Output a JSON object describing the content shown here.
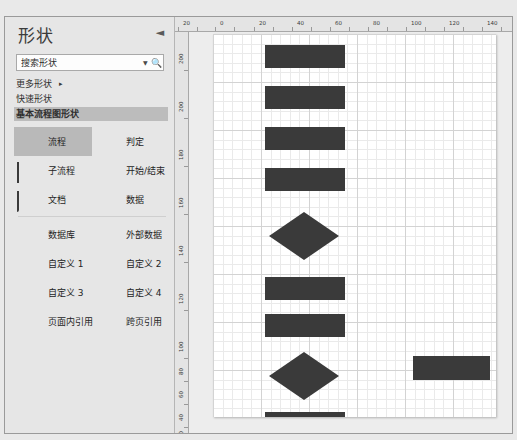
{
  "panel": {
    "title": "形状",
    "collapse_icon": "chevron-left-icon",
    "search": {
      "value": "搜索形状",
      "placeholder": "搜索形状",
      "dropdown_icon": "chevron-down-icon",
      "search_icon": "magnifier-icon"
    },
    "menu": [
      {
        "label": "更多形状",
        "arrow": "▸",
        "selected": false
      },
      {
        "label": "快速形状",
        "arrow": "",
        "selected": false
      },
      {
        "label": "基本流程图形状",
        "arrow": "",
        "selected": true
      }
    ],
    "shape_groups": [
      {
        "rows": [
          [
            {
              "label": "流程",
              "glyph": "rect-filled-icon",
              "selected": true
            },
            {
              "label": "判定",
              "glyph": "diamond-icon",
              "selected": false
            }
          ],
          [
            {
              "label": "子流程",
              "glyph": "subprocess-icon",
              "selected": false
            },
            {
              "label": "开始/结束",
              "glyph": "rounded-terminator-icon",
              "selected": false
            }
          ],
          [
            {
              "label": "文档",
              "glyph": "document-icon",
              "selected": false
            },
            {
              "label": "数据",
              "glyph": "parallelogram-data-icon",
              "selected": false
            }
          ]
        ]
      },
      {
        "rows": [
          [
            {
              "label": "数据库",
              "glyph": "database-icon",
              "selected": false
            },
            {
              "label": "外部数据",
              "glyph": "external-data-icon",
              "selected": false
            }
          ],
          [
            {
              "label": "自定义 1",
              "glyph": "custom1-icon",
              "selected": false
            },
            {
              "label": "自定义 2",
              "glyph": "custom2-icon",
              "selected": false
            }
          ],
          [
            {
              "label": "自定义 3",
              "glyph": "custom3-icon",
              "selected": false
            },
            {
              "label": "自定义 4",
              "glyph": "custom4-icon",
              "selected": false
            }
          ],
          [
            {
              "label": "页面内引用",
              "glyph": "on-page-reference-icon",
              "selected": false
            },
            {
              "label": "跨页引用",
              "glyph": "off-page-reference-icon",
              "selected": false
            }
          ]
        ]
      }
    ]
  },
  "canvas": {
    "ruler_h": {
      "unit_labels": [
        "20",
        "0",
        "20",
        "40",
        "60",
        "80",
        "100",
        "120",
        "140",
        "160",
        "180",
        "200"
      ],
      "positions_px": [
        8,
        45,
        84,
        122,
        160,
        198,
        236,
        274,
        312,
        350,
        388,
        426
      ]
    },
    "ruler_v": {
      "unit_labels": [
        "200",
        "200",
        "180",
        "160",
        "140",
        "120",
        "100",
        "80",
        "60",
        "40",
        "20"
      ],
      "positions_px": [
        22,
        70,
        118,
        166,
        214,
        262,
        310,
        333,
        356,
        379,
        396
      ]
    },
    "shapes": [
      {
        "name": "process-rect-1",
        "type": "rect",
        "x": 52,
        "y": 11,
        "w": 80,
        "h": 23
      },
      {
        "name": "process-rect-2",
        "type": "rect",
        "x": 52,
        "y": 52,
        "w": 80,
        "h": 23
      },
      {
        "name": "process-rect-3",
        "type": "rect",
        "x": 52,
        "y": 93,
        "w": 80,
        "h": 23
      },
      {
        "name": "process-rect-4",
        "type": "rect",
        "x": 52,
        "y": 134,
        "w": 80,
        "h": 23
      },
      {
        "name": "decision-diamond-1",
        "type": "diamond",
        "x": 56,
        "y": 178,
        "w": 70,
        "h": 48
      },
      {
        "name": "process-rect-5",
        "type": "rect",
        "x": 52,
        "y": 243,
        "w": 80,
        "h": 23
      },
      {
        "name": "process-rect-6",
        "type": "rect",
        "x": 52,
        "y": 280,
        "w": 80,
        "h": 23
      },
      {
        "name": "decision-diamond-2",
        "type": "diamond",
        "x": 56,
        "y": 318,
        "w": 70,
        "h": 48
      },
      {
        "name": "process-rect-7",
        "type": "rect",
        "x": 52,
        "y": 378,
        "w": 80,
        "h": 23
      },
      {
        "name": "process-rect-side",
        "type": "rect",
        "x": 200,
        "y": 322,
        "w": 77,
        "h": 24
      }
    ]
  }
}
